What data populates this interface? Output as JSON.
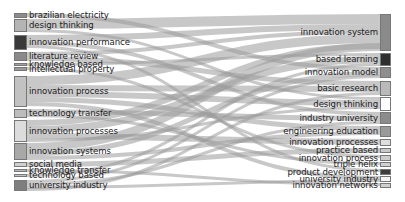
{
  "diagram": {
    "type": "sankey",
    "left_nodes": [
      {
        "label": "brazilian electricity",
        "y0": 13,
        "y1": 18,
        "color": "#8c8c8c"
      },
      {
        "label": "design thinking",
        "y0": 19,
        "y1": 32,
        "color": "#b4b4b4"
      },
      {
        "label": "innovation performance",
        "y0": 35,
        "y1": 50,
        "color": "#3a3a3a"
      },
      {
        "label": "literature review",
        "y0": 52,
        "y1": 61,
        "color": "#8a8a8a"
      },
      {
        "label": "knowledge based",
        "y0": 63,
        "y1": 66,
        "color": "#a0a0a0"
      },
      {
        "label": "intellectual property",
        "y0": 67,
        "y1": 71,
        "color": "#9a9a9a"
      },
      {
        "label": "innovation process",
        "y0": 76,
        "y1": 107,
        "color": "#c2c2c2"
      },
      {
        "label": "technology transfer",
        "y0": 109,
        "y1": 118,
        "color": "#bdbdbd"
      },
      {
        "label": "innovation processes",
        "y0": 120,
        "y1": 142,
        "color": "#dcdcdc"
      },
      {
        "label": "innovation systems",
        "y0": 143,
        "y1": 160,
        "color": "#a8a8a8"
      },
      {
        "label": "social media",
        "y0": 162,
        "y1": 167,
        "color": "#cfcfcf"
      },
      {
        "label": "knowledge transfer",
        "y0": 169,
        "y1": 172,
        "color": "#b8b8b8"
      },
      {
        "label": "technology based",
        "y0": 174,
        "y1": 177,
        "color": "#c4c4c4"
      },
      {
        "label": "university industry",
        "y0": 180,
        "y1": 191,
        "color": "#7e7e7e"
      }
    ],
    "right_nodes": [
      {
        "label": "innovation system",
        "y0": 14,
        "y1": 51,
        "color": "#8a8a8a"
      },
      {
        "label": "based learning",
        "y0": 53,
        "y1": 66,
        "color": "#2e2e2e"
      },
      {
        "label": "innovation model",
        "y0": 67,
        "y1": 78,
        "color": "#8e8e8e"
      },
      {
        "label": "basic research",
        "y0": 81,
        "y1": 96,
        "color": "#bababa"
      },
      {
        "label": "design thinking",
        "y0": 97,
        "y1": 111,
        "color": "#ffffff"
      },
      {
        "label": "industry university",
        "y0": 112,
        "y1": 124,
        "color": "#8c8c8c"
      },
      {
        "label": "engineering education",
        "y0": 126,
        "y1": 137,
        "color": "#9a9a9a"
      },
      {
        "label": "innovation processes",
        "y0": 139,
        "y1": 146,
        "color": "#dedede"
      },
      {
        "label": "practice based",
        "y0": 148,
        "y1": 153,
        "color": "#c8c8c8"
      },
      {
        "label": "innovation process",
        "y0": 155,
        "y1": 161,
        "color": "#cccccc"
      },
      {
        "label": "triple helix",
        "y0": 162,
        "y1": 167,
        "color": "#d0d0d0"
      },
      {
        "label": "product development",
        "y0": 169,
        "y1": 175,
        "color": "#3c3c3c"
      },
      {
        "label": "university industry",
        "y0": 176,
        "y1": 182,
        "color": "#f4f4f4"
      },
      {
        "label": "innovation networks",
        "y0": 183,
        "y1": 188,
        "color": "#cfcfcf"
      }
    ],
    "links": [
      {
        "source": 0,
        "target": 2,
        "width": 4
      },
      {
        "source": 1,
        "target": 0,
        "width": 10
      },
      {
        "source": 1,
        "target": 4,
        "width": 3
      },
      {
        "source": 2,
        "target": 0,
        "width": 6
      },
      {
        "source": 2,
        "target": 5,
        "width": 4
      },
      {
        "source": 2,
        "target": 11,
        "width": 3
      },
      {
        "source": 3,
        "target": 0,
        "width": 4
      },
      {
        "source": 3,
        "target": 3,
        "width": 5
      },
      {
        "source": 4,
        "target": 1,
        "width": 3
      },
      {
        "source": 5,
        "target": 9,
        "width": 3
      },
      {
        "source": 6,
        "target": 0,
        "width": 9
      },
      {
        "source": 6,
        "target": 3,
        "width": 6
      },
      {
        "source": 6,
        "target": 4,
        "width": 6
      },
      {
        "source": 6,
        "target": 6,
        "width": 5
      },
      {
        "source": 6,
        "target": 12,
        "width": 4
      },
      {
        "source": 7,
        "target": 5,
        "width": 5
      },
      {
        "source": 7,
        "target": 10,
        "width": 3
      },
      {
        "source": 8,
        "target": 0,
        "width": 6
      },
      {
        "source": 8,
        "target": 1,
        "width": 7
      },
      {
        "source": 8,
        "target": 7,
        "width": 6
      },
      {
        "source": 8,
        "target": 4,
        "width": 3
      },
      {
        "source": 9,
        "target": 0,
        "width": 8
      },
      {
        "source": 9,
        "target": 2,
        "width": 5
      },
      {
        "source": 9,
        "target": 6,
        "width": 4
      },
      {
        "source": 10,
        "target": 8,
        "width": 5
      },
      {
        "source": 11,
        "target": 13,
        "width": 3
      },
      {
        "source": 12,
        "target": 1,
        "width": 3
      },
      {
        "source": 13,
        "target": 2,
        "width": 3
      },
      {
        "source": 13,
        "target": 5,
        "width": 3
      },
      {
        "source": 13,
        "target": 12,
        "width": 3
      },
      {
        "source": 13,
        "target": 3,
        "width": 3
      }
    ],
    "link_color": "#9a9a9a",
    "link_opacity": 0.55
  }
}
